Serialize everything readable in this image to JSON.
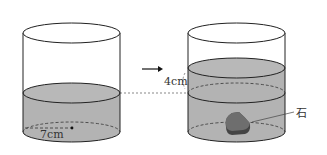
{
  "diagram": {
    "left_cylinder": {
      "radius_label": "7cm"
    },
    "arrow": "→",
    "right_cylinder": {
      "rise_label": "4cm",
      "stone_label": "石"
    },
    "colors": {
      "water": "#b3b3b3",
      "stroke": "#222222",
      "stone": "#6e6e6e",
      "stone_dark": "#444444"
    }
  }
}
